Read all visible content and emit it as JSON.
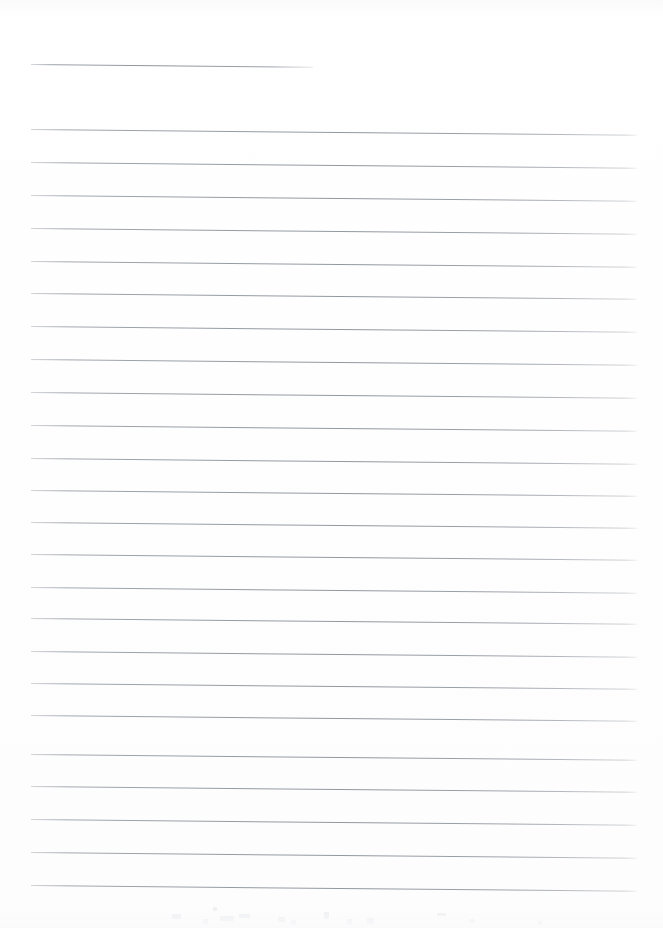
{
  "document": {
    "kind": "lined-notebook-paper-scan",
    "title": "Blank ruled notepaper page",
    "page_width": 663,
    "page_height": 928,
    "background_color": "#ffffff",
    "rule_color": "#989ea6",
    "rule_thickness_px": 1,
    "content_text": "",
    "has_handwriting": false,
    "has_printed_text": false
  },
  "ruling": {
    "left_margin_x": 31,
    "right_margin_x": 637,
    "line_spacing_px": 32.1,
    "tilt_degrees": 0.55,
    "first_line_is_short": true,
    "short_line_end_x": 313,
    "line_count": 25,
    "lines": [
      {
        "index": 1,
        "y": 64,
        "x_start": 31,
        "x_end": 313,
        "short": true
      },
      {
        "index": 2,
        "y": 129,
        "x_start": 31,
        "x_end": 637,
        "short": false
      },
      {
        "index": 3,
        "y": 162,
        "x_start": 31,
        "x_end": 637,
        "short": false
      },
      {
        "index": 4,
        "y": 195,
        "x_start": 31,
        "x_end": 637,
        "short": false
      },
      {
        "index": 5,
        "y": 228,
        "x_start": 31,
        "x_end": 637,
        "short": false
      },
      {
        "index": 6,
        "y": 261,
        "x_start": 31,
        "x_end": 637,
        "short": false
      },
      {
        "index": 7,
        "y": 293,
        "x_start": 31,
        "x_end": 637,
        "short": false
      },
      {
        "index": 8,
        "y": 326,
        "x_start": 31,
        "x_end": 637,
        "short": false
      },
      {
        "index": 9,
        "y": 359,
        "x_start": 31,
        "x_end": 637,
        "short": false
      },
      {
        "index": 10,
        "y": 392,
        "x_start": 31,
        "x_end": 637,
        "short": false
      },
      {
        "index": 11,
        "y": 425,
        "x_start": 31,
        "x_end": 637,
        "short": false
      },
      {
        "index": 12,
        "y": 458,
        "x_start": 31,
        "x_end": 637,
        "short": false
      },
      {
        "index": 13,
        "y": 490,
        "x_start": 31,
        "x_end": 637,
        "short": false
      },
      {
        "index": 14,
        "y": 522,
        "x_start": 31,
        "x_end": 637,
        "short": false
      },
      {
        "index": 15,
        "y": 554,
        "x_start": 31,
        "x_end": 637,
        "short": false
      },
      {
        "index": 16,
        "y": 587,
        "x_start": 31,
        "x_end": 637,
        "short": false
      },
      {
        "index": 17,
        "y": 618,
        "x_start": 31,
        "x_end": 637,
        "short": false
      },
      {
        "index": 18,
        "y": 651,
        "x_start": 31,
        "x_end": 637,
        "short": false
      },
      {
        "index": 19,
        "y": 683,
        "x_start": 31,
        "x_end": 637,
        "short": false
      },
      {
        "index": 20,
        "y": 715,
        "x_start": 31,
        "x_end": 637,
        "short": false
      },
      {
        "index": 21,
        "y": 754,
        "x_start": 31,
        "x_end": 637,
        "short": false
      },
      {
        "index": 22,
        "y": 786,
        "x_start": 31,
        "x_end": 637,
        "short": false
      },
      {
        "index": 23,
        "y": 819,
        "x_start": 31,
        "x_end": 637,
        "short": false
      },
      {
        "index": 24,
        "y": 852,
        "x_start": 31,
        "x_end": 637,
        "short": false
      },
      {
        "index": 25,
        "y": 885,
        "x_start": 31,
        "x_end": 637,
        "short": false
      }
    ]
  },
  "artifacts": {
    "description": "Very faint scanner bleed-through marks along the lower edge",
    "marks": [
      {
        "x": 172,
        "y": 914,
        "w": 9,
        "h": 5
      },
      {
        "x": 203,
        "y": 919,
        "w": 5,
        "h": 6
      },
      {
        "x": 213,
        "y": 907,
        "w": 4,
        "h": 4
      },
      {
        "x": 220,
        "y": 916,
        "w": 14,
        "h": 5
      },
      {
        "x": 239,
        "y": 914,
        "w": 11,
        "h": 4
      },
      {
        "x": 278,
        "y": 917,
        "w": 7,
        "h": 5
      },
      {
        "x": 291,
        "y": 920,
        "w": 5,
        "h": 5
      },
      {
        "x": 324,
        "y": 912,
        "w": 5,
        "h": 7
      },
      {
        "x": 347,
        "y": 919,
        "w": 5,
        "h": 6
      },
      {
        "x": 367,
        "y": 918,
        "w": 7,
        "h": 6
      },
      {
        "x": 437,
        "y": 913,
        "w": 9,
        "h": 3
      },
      {
        "x": 470,
        "y": 919,
        "w": 4,
        "h": 4
      },
      {
        "x": 538,
        "y": 921,
        "w": 4,
        "h": 4
      }
    ]
  }
}
